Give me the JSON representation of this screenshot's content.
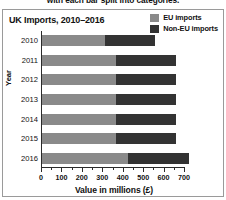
{
  "caption": {
    "text": "with each bar split into categories."
  },
  "chart_data": {
    "type": "bar",
    "orientation": "horizontal",
    "stacked": true,
    "title": "UK Imports, 2010–2016",
    "xlabel": "Value in millions (£)",
    "ylabel": "Year",
    "categories": [
      "2010",
      "2011",
      "2012",
      "2013",
      "2014",
      "2015",
      "2016"
    ],
    "series": [
      {
        "name": "EU imports",
        "color": "#8a8a8a",
        "values": [
          310,
          360,
          360,
          360,
          360,
          360,
          420
        ]
      },
      {
        "name": "Non-EU imports",
        "color": "#333333",
        "values": [
          245,
          295,
          295,
          295,
          295,
          295,
          300
        ]
      }
    ],
    "totals": [
      555,
      655,
      655,
      655,
      655,
      655,
      720
    ],
    "xlim": [
      0,
      700
    ],
    "xticks": [
      0,
      100,
      200,
      300,
      400,
      500,
      600,
      700
    ],
    "xtick_labels": [
      "0",
      "100",
      "200",
      "300",
      "400",
      "500",
      "600",
      "700"
    ],
    "grid": false,
    "legend_position": "top-right",
    "legend": [
      "EU imports",
      "Non-EU imports"
    ]
  }
}
